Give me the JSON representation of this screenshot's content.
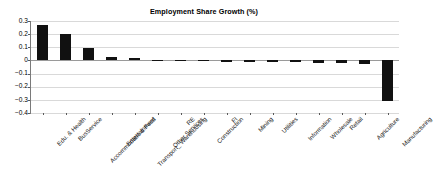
{
  "chart_data": {
    "type": "bar",
    "title": "Employment Share Growth (%)",
    "xlabel": "",
    "ylabel": "",
    "ylim": [
      -0.4,
      0.3
    ],
    "grid": true,
    "legend": false,
    "legend_position": "none",
    "orientation": "vertical",
    "bar_color": "#111111",
    "ytick_labels": [
      "0.3",
      "0.2",
      "0.1",
      "0",
      "−0.1",
      "−0.2",
      "−0.3",
      "−0.4"
    ],
    "ytick_values": [
      0.3,
      0.2,
      0.1,
      0,
      -0.1,
      -0.2,
      -0.3,
      -0.4
    ],
    "categories": [
      "Edu. & Health",
      "BusService",
      "Accommodatio & Food",
      "Entertainment",
      "Transport_ Warehousing",
      "Other Services",
      "RE",
      "Construction",
      "FI",
      "Mining",
      "Utilities",
      "Information",
      "Wholesale",
      "Retail",
      "Agriculture",
      "Manufacturing"
    ],
    "values": [
      0.272,
      0.202,
      0.098,
      0.025,
      0.018,
      0.004,
      0.003,
      0.002,
      -0.006,
      -0.008,
      -0.01,
      -0.013,
      -0.016,
      -0.019,
      -0.031,
      -0.311
    ]
  }
}
